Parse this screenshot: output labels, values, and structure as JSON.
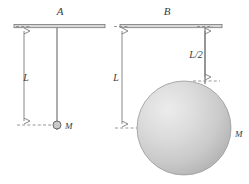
{
  "figure": {
    "background_color": "#ffffff",
    "line_color": "#6e6e6e",
    "sphere_fill_light": "#e8e8e8",
    "sphere_fill_dark": "#b9b9b9",
    "panels": [
      {
        "letter": "A",
        "length_label": "L",
        "mass_label": "M",
        "bob_type": "point-mass",
        "ceiling": {
          "x1": 14,
          "x2": 105,
          "y": 26
        },
        "rod": {
          "x": 57,
          "y1": 27,
          "y2": 125
        },
        "bob": {
          "cx": 57,
          "cy": 125,
          "r": 4
        },
        "dimension_L": {
          "x": 24,
          "y1": 27,
          "y2": 125
        },
        "letter_pos": {
          "x": 60,
          "y": 15
        },
        "length_label_pos": {
          "x": 26,
          "y": 80
        },
        "mass_label_pos": {
          "x": 65,
          "y": 129
        }
      },
      {
        "letter": "B",
        "length_label": "L",
        "half_length_label": "L/2",
        "mass_label": "M",
        "bob_type": "extended-sphere",
        "ceiling": {
          "x1": 120,
          "x2": 222,
          "y": 26
        },
        "rod": {
          "x": 205,
          "y1": 27,
          "y2": 81
        },
        "sphere": {
          "cx": 184,
          "cy": 128,
          "r": 47
        },
        "dimension_L": {
          "x": 122,
          "y1": 27,
          "y2": 128
        },
        "dimension_half_L": {
          "x": 205,
          "y1": 27,
          "y2": 81
        },
        "letter_pos": {
          "x": 167,
          "y": 15
        },
        "length_label_pos": {
          "x": 116,
          "y": 80
        },
        "half_length_label_pos": {
          "x": 188,
          "y": 57
        },
        "mass_label_pos": {
          "x": 235,
          "y": 137
        }
      }
    ]
  }
}
